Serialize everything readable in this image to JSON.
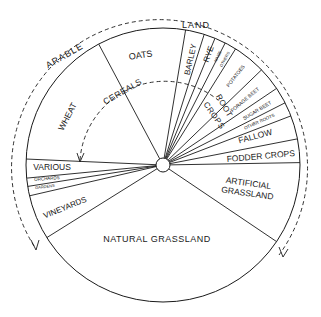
{
  "diagram": {
    "center": [
      163,
      165
    ],
    "radius": 137,
    "hub_radius": 7,
    "ink_color": "#1a1a1a",
    "background_color": "#ffffff",
    "outer_arc_label_left": "ARABLE",
    "outer_arc_label_top": "LAND",
    "inner_arc_label": "CEREALS",
    "root_crops_label_1": "ROOT",
    "root_crops_label_2": "CROPS",
    "segments": [
      {
        "label": "WHEAT",
        "start": -177.5,
        "end": -118
      },
      {
        "label": "OATS",
        "start": -118,
        "end": -80.5
      },
      {
        "label": "BARLEY",
        "start": -80.5,
        "end": -72.5
      },
      {
        "label": "RYE",
        "start": -72.5,
        "end": -67.7
      },
      {
        "label": "MAIZE",
        "start": -67.7,
        "end": -63
      },
      {
        "label": "OTHERS",
        "start": -63,
        "end": -58
      },
      {
        "label": "POTATOES",
        "start": -58,
        "end": -44
      },
      {
        "label": "FORAGE BEET",
        "start": -44,
        "end": -34
      },
      {
        "label": "SUGAR BEET",
        "start": -34,
        "end": -27
      },
      {
        "label": "OTHER ROOTS",
        "start": -27,
        "end": -21
      },
      {
        "label": "FALLOW",
        "start": -21,
        "end": -11
      },
      {
        "label": "FODDER CROPS",
        "start": -11,
        "end": -1
      },
      {
        "label": "ARTIFICIAL GRASSLAND",
        "start": -1,
        "end": 34
      },
      {
        "label": "NATURAL GRASSLAND",
        "start": 34,
        "end": 148
      },
      {
        "label": "VINEYARDS",
        "start": 148,
        "end": 167
      },
      {
        "label": "GARDENS",
        "start": 167,
        "end": 171
      },
      {
        "label": "ORCHARDS",
        "start": 171,
        "end": 174.5
      },
      {
        "label": "VARIOUS",
        "start": 174.5,
        "end": 182.5
      }
    ]
  },
  "labels": {
    "wheat": "WHEAT",
    "oats": "OATS",
    "barley": "BARLEY",
    "rye": "RYE",
    "maize": "MAIZE",
    "others": "OTHERS",
    "potatoes": "POTATOES",
    "forage_beet": "FORAGE BEET",
    "sugar_beet": "SUGAR BEET",
    "other_roots": "OTHER ROOTS",
    "fallow": "FALLOW",
    "fodder_crops": "FODDER CROPS",
    "artificial_1": "ARTIFICIAL",
    "artificial_2": "GRASSLAND",
    "natural_grassland": "NATURAL GRASSLAND",
    "vineyards": "VINEYARDS",
    "gardens": "GARDENS",
    "orchards": "ORCHARDS",
    "various": "VARIOUS",
    "arable": "ARABLE",
    "land": "LAND",
    "cereals": "CEREALS",
    "root": "ROOT",
    "crops": "CROPS"
  }
}
